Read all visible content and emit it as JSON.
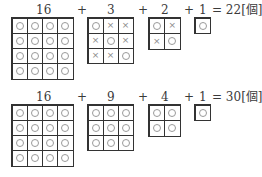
{
  "rows": [
    {
      "terms": [
        {
          "label": "16",
          "size": 4,
          "cells": [
            "o",
            "o",
            "o",
            "o",
            "o",
            "o",
            "o",
            "o",
            "o",
            "o",
            "o",
            "o",
            "o",
            "o",
            "o",
            "o"
          ]
        },
        {
          "label": "3",
          "size": 3,
          "cells": [
            "o",
            "x",
            "x",
            "x",
            "o",
            "x",
            "x",
            "x",
            "o"
          ]
        },
        {
          "label": "2",
          "size": 2,
          "cells": [
            "o",
            "x",
            "x",
            "o"
          ]
        },
        {
          "label": "1",
          "size": 1,
          "cells": [
            "o"
          ]
        }
      ],
      "plus": "+",
      "result": "= 22[個]"
    },
    {
      "terms": [
        {
          "label": "16",
          "size": 4,
          "cells": [
            "o",
            "o",
            "o",
            "o",
            "o",
            "o",
            "o",
            "o",
            "o",
            "o",
            "o",
            "o",
            "o",
            "o",
            "o",
            "o"
          ]
        },
        {
          "label": "9",
          "size": 3,
          "cells": [
            "o",
            "o",
            "o",
            "o",
            "o",
            "o",
            "o",
            "o",
            "o"
          ]
        },
        {
          "label": "4",
          "size": 2,
          "cells": [
            "o",
            "o",
            "o",
            "o"
          ]
        },
        {
          "label": "1",
          "size": 1,
          "cells": [
            "o"
          ]
        }
      ],
      "plus": "+",
      "result": "= 30[個]"
    }
  ],
  "marks": {
    "o": "circle",
    "x": "×"
  }
}
